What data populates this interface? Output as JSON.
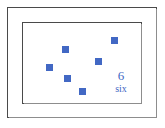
{
  "card": {
    "outer_border_color": "#4a4a4a",
    "inner_border_color": "#4a4a4a",
    "background_color": "#ffffff"
  },
  "counting_panel": {
    "marker_color": "#4268c4",
    "marker_shape": "square",
    "marker_count": 6,
    "numeral_label": "6",
    "word_label": "six",
    "label_color": "#4268c4",
    "markers": [
      {
        "name": "marker-1",
        "x": 62,
        "y": 46
      },
      {
        "name": "marker-2",
        "x": 111,
        "y": 37
      },
      {
        "name": "marker-3",
        "x": 95,
        "y": 58
      },
      {
        "name": "marker-4",
        "x": 46,
        "y": 64
      },
      {
        "name": "marker-5",
        "x": 64,
        "y": 75
      },
      {
        "name": "marker-6",
        "x": 79,
        "y": 88
      }
    ]
  }
}
